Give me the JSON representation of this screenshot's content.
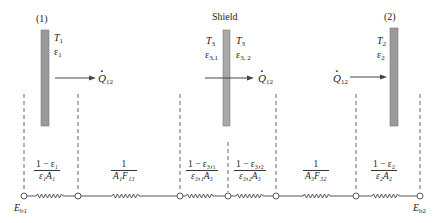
{
  "colors": {
    "plate": "#9a9a9a",
    "plate_edge": "#777777",
    "line": "#444444",
    "background": "#ffffff"
  },
  "plates": {
    "plate1": {
      "label": "(1)",
      "T": "T",
      "T_sub": "1",
      "eps": "ε",
      "eps_sub": "1"
    },
    "shield": {
      "label": "Shield",
      "left_T": "T",
      "left_T_sub": "3",
      "left_eps": "ε",
      "left_eps_sub": "3,1",
      "right_T": "T",
      "right_T_sub": "3",
      "right_eps": "ε",
      "right_eps_sub": "3, 2"
    },
    "plate2": {
      "label": "(2)",
      "T": "T",
      "T_sub": "2",
      "eps": "ε",
      "eps_sub": "2"
    }
  },
  "heat_flow": {
    "symbol": "Q",
    "sub": "12",
    "arrows": [
      "plate1-to-right",
      "through-shield",
      "into-plate2"
    ]
  },
  "network": {
    "nodes": [
      {
        "id": "Eb1",
        "label": "E",
        "sub": "b1"
      },
      {
        "id": "J1"
      },
      {
        "id": "J31"
      },
      {
        "id": "Eb3"
      },
      {
        "id": "J32"
      },
      {
        "id": "J2"
      },
      {
        "id": "Eb2",
        "label": "E",
        "sub": "b2"
      }
    ],
    "resistances": [
      {
        "name": "surface-resistance-1",
        "num": "1 − ε₁",
        "den": "ε₁A₁"
      },
      {
        "name": "space-resistance-13",
        "num": "1",
        "den": "A₁F₁₃"
      },
      {
        "name": "surface-resistance-31",
        "num": "1 − ε₃,₁",
        "den": "ε₃,₁A₃"
      },
      {
        "name": "surface-resistance-32",
        "num": "1 − ε₃,₂",
        "den": "ε₃,₂A₃"
      },
      {
        "name": "space-resistance-32",
        "num": "1",
        "den": "A₃F₃₂"
      },
      {
        "name": "surface-resistance-2",
        "num": "1 − ε₂",
        "den": "ε₂A₂"
      }
    ]
  }
}
